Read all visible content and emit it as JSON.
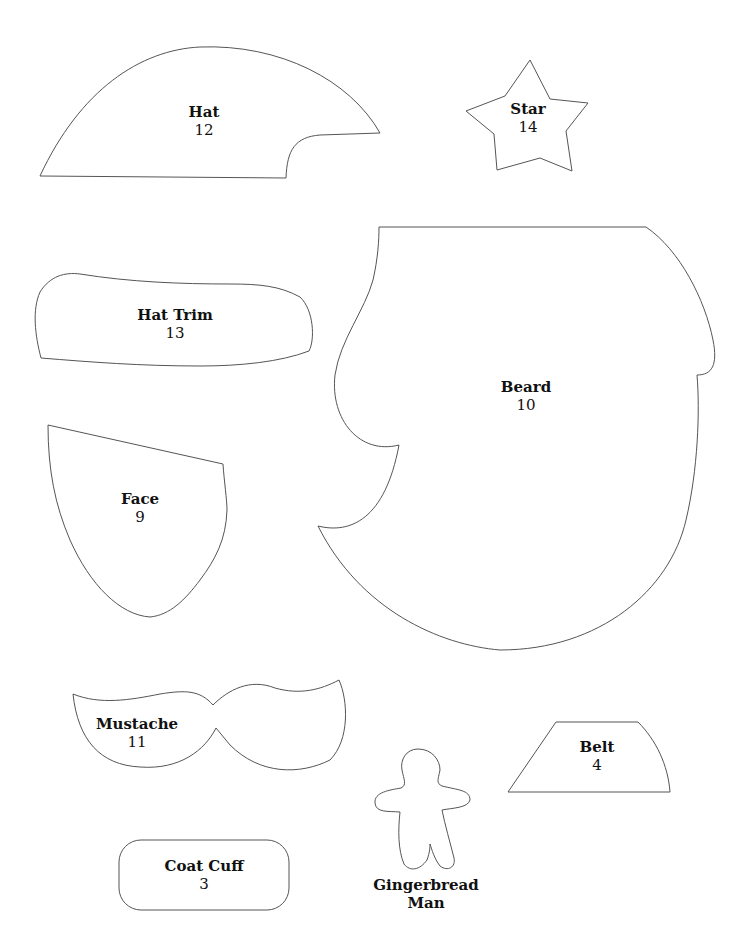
{
  "page": {
    "background": "#ffffff",
    "outline_color": "#555555",
    "text_color": "#111111"
  },
  "pieces": {
    "hat": {
      "name": "Hat",
      "number": "12"
    },
    "star": {
      "name": "Star",
      "number": "14"
    },
    "hat_trim": {
      "name": "Hat Trim",
      "number": "13"
    },
    "beard": {
      "name": "Beard",
      "number": "10"
    },
    "face": {
      "name": "Face",
      "number": "9"
    },
    "mustache": {
      "name": "Mustache",
      "number": "11"
    },
    "belt": {
      "name": "Belt",
      "number": "4"
    },
    "gingerbread_man": {
      "name_line1": "Gingerbread",
      "name_line2": "Man"
    },
    "coat_cuff": {
      "name": "Coat Cuff",
      "number": "3"
    }
  }
}
